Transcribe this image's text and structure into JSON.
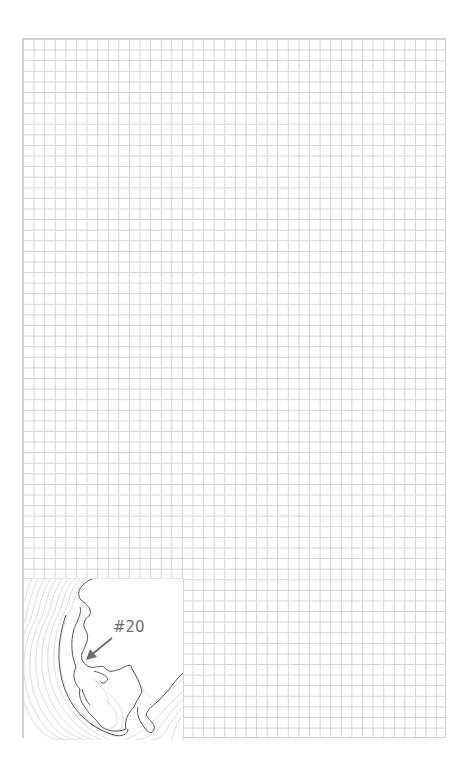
{
  "grid": {
    "columns": 40,
    "rows": 66,
    "line_color": "#d4d4d4"
  },
  "map_inset": {
    "marker_label": "#20",
    "marker_color": "#6f6f6f",
    "coastline_color": "#555555",
    "contour_color": "#c8c8c8"
  }
}
